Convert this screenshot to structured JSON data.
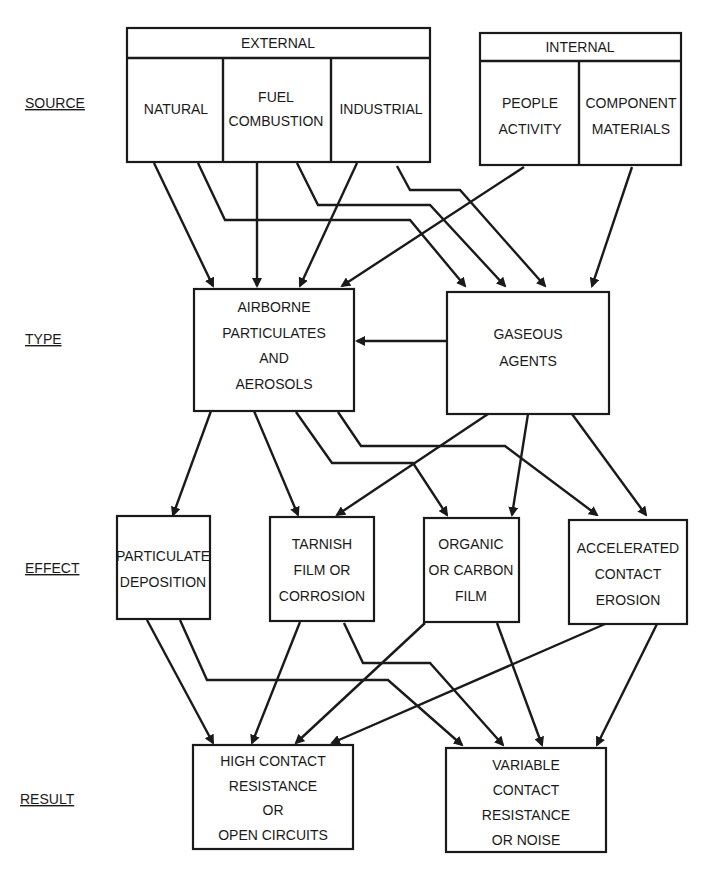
{
  "row_labels": {
    "source": "SOURCE",
    "type": "TYPE",
    "effect": "EFFECT",
    "result": "RESULT"
  },
  "source": {
    "external": {
      "header": "EXTERNAL",
      "items": [
        [
          "NATURAL"
        ],
        [
          "FUEL",
          "COMBUSTION"
        ],
        [
          "INDUSTRIAL"
        ]
      ]
    },
    "internal": {
      "header": "INTERNAL",
      "items": [
        [
          "PEOPLE",
          "ACTIVITY"
        ],
        [
          "COMPONENT",
          "MATERIALS"
        ]
      ]
    }
  },
  "type": {
    "airborne": [
      "AIRBORNE",
      "PARTICULATES",
      "AND",
      "AEROSOLS"
    ],
    "gaseous": [
      "GASEOUS",
      "AGENTS"
    ]
  },
  "effect": [
    [
      "PARTICULATE",
      "DEPOSITION"
    ],
    [
      "TARNISH",
      "FILM OR",
      "CORROSION"
    ],
    [
      "ORGANIC",
      "OR CARBON",
      "FILM"
    ],
    [
      "ACCELERATED",
      "CONTACT",
      "EROSION"
    ]
  ],
  "result": [
    [
      "HIGH  CONTACT",
      "RESISTANCE",
      "OR",
      "OPEN CIRCUITS"
    ],
    [
      "VARIABLE",
      "CONTACT",
      "RESISTANCE",
      "OR  NOISE"
    ]
  ]
}
